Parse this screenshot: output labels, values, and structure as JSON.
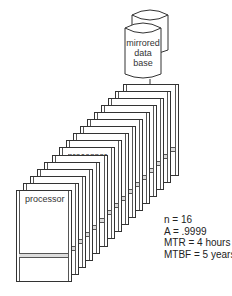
{
  "diagram": {
    "database": {
      "label_lines": [
        "mirrored",
        "data",
        "base"
      ],
      "shape": "double-cylinder"
    },
    "processors": {
      "count": 16,
      "label": "processor"
    },
    "stats": {
      "n": "n = 16",
      "a": "A =  .9999",
      "mtr": "MTR = 4 hours",
      "mtbf": "MTBF = 5 years"
    }
  }
}
